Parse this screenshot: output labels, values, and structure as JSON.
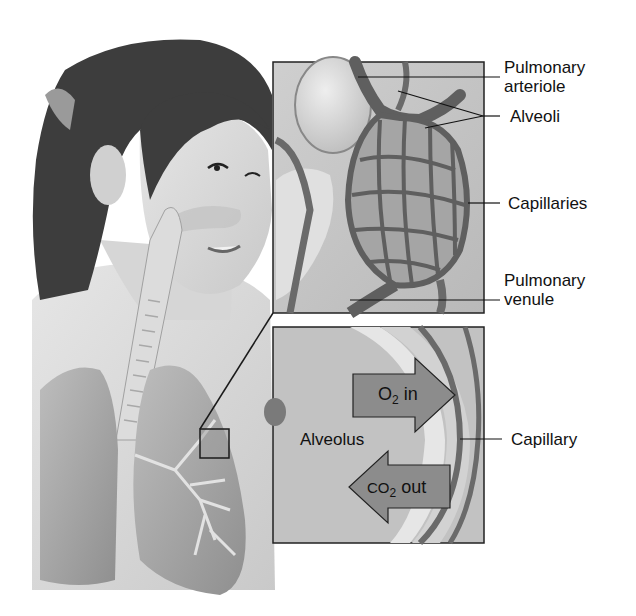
{
  "figure": {
    "colors": {
      "background": "#ffffff",
      "hair": "#3a3a3a",
      "skin": "#d8d8d8",
      "lung": "#a9a9a9",
      "vessel": "#6e6e6e",
      "box_border": "#222222",
      "arrow_fill": "#8c8c8c"
    }
  },
  "upper_inset": {
    "name": "alveolar sac with capillary network",
    "labels": [
      {
        "id": "pulmonary-arteriole",
        "line1": "Pulmonary",
        "line2": "arteriole"
      },
      {
        "id": "alveoli",
        "line1": "Alveoli"
      },
      {
        "id": "capillaries",
        "line1": "Capillaries"
      },
      {
        "id": "pulmonary-venule",
        "line1": "Pulmonary",
        "line2": "venule"
      }
    ]
  },
  "lower_inset": {
    "name": "alveolus-capillary interface",
    "alveolus_label": "Alveolus",
    "capillary_label": "Capillary",
    "arrow_in": {
      "molecule": "O",
      "subscript": "2",
      "direction_text": "in"
    },
    "arrow_out": {
      "molecule": "CO",
      "subscript": "2",
      "direction_text": "out"
    }
  }
}
